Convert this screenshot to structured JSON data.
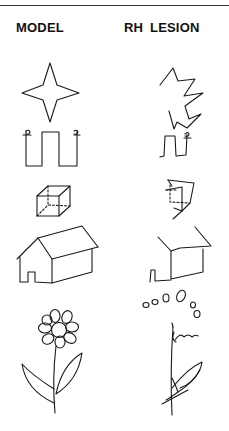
{
  "figure": {
    "columns": [
      {
        "id": "model",
        "label": "MODEL"
      },
      {
        "id": "rh_lesion",
        "label": "RH  LESION"
      }
    ],
    "rows": [
      {
        "item": "star"
      },
      {
        "item": "square-wave-pattern"
      },
      {
        "item": "cube"
      },
      {
        "item": "house"
      },
      {
        "item": "flower"
      }
    ]
  }
}
